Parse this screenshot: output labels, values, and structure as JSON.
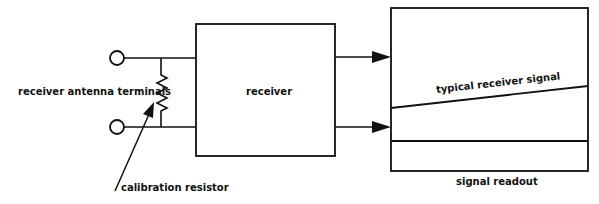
{
  "diagram": {
    "labels": {
      "antenna_terminals": "receiver antenna terminals",
      "calibration_resistor": "calibration resistor",
      "receiver": "receiver",
      "typical_signal": "typical receiver signal",
      "signal_readout": "signal readout"
    },
    "colors": {
      "line": "#111111",
      "background": "#ffffff"
    }
  }
}
